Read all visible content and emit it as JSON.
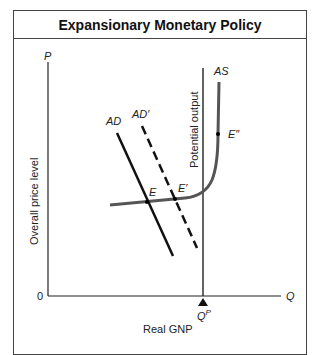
{
  "title": "Expansionary Monetary Policy",
  "axes": {
    "y_label": "P",
    "x_label": "Q",
    "origin": "0",
    "y_title": "Overall price level",
    "x_title": "Real GNP",
    "x_marker": "Q",
    "x_marker_sup": "P"
  },
  "curves": {
    "ad": "AD",
    "ad_prime": "AD′",
    "as": "AS",
    "potential": "Potential output"
  },
  "points": {
    "e": "E",
    "e_prime": "E′",
    "e_double": "E″"
  },
  "colors": {
    "line": "#111111",
    "as_curve": "#555555",
    "frame": "#444444"
  }
}
